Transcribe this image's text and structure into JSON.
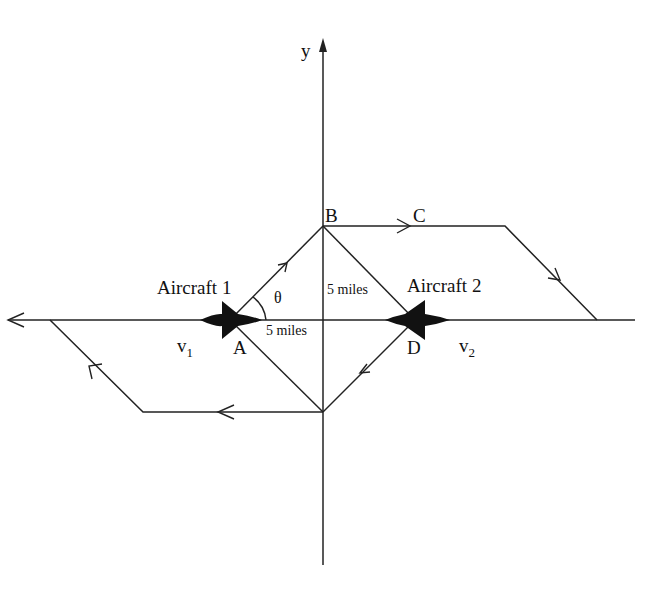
{
  "diagram": {
    "type": "aircraft-encounter-geometry",
    "axis": {
      "y_label": "y"
    },
    "points": {
      "A": "A",
      "B": "B",
      "C": "C",
      "D": "D"
    },
    "aircraft": [
      {
        "label": "Aircraft 1",
        "velocity": "v",
        "velocity_sub": "1"
      },
      {
        "label": "Aircraft 2",
        "velocity": "v",
        "velocity_sub": "2"
      }
    ],
    "angle_label": "θ",
    "distances": {
      "horizontal": "5 miles",
      "diagonal": "5 miles"
    },
    "colors": {
      "ink": "#111111",
      "background": "#ffffff"
    }
  }
}
